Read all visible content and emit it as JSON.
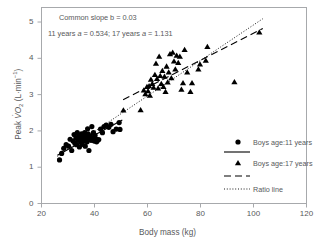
{
  "chart_data": {
    "type": "scatter",
    "title": "",
    "xlabel": "Body mass (kg)",
    "ylabel_plain": "Peak VO2 (L·min-1)",
    "xlim": [
      20,
      120
    ],
    "ylim": [
      0,
      5.4
    ],
    "xticks": [
      20,
      40,
      60,
      80,
      100,
      120
    ],
    "yticks": [
      0,
      1,
      2,
      3,
      4,
      5
    ],
    "grid": false,
    "legend_position": "right-middle",
    "annotations": [
      "Common  slope b = 0.03",
      "11 years a = 0.534; 17 years a = 1.131"
    ],
    "series": [
      {
        "name": "Boys age:11 years",
        "marker": "circle",
        "color": "#000000",
        "points": [
          [
            26.8,
            1.2
          ],
          [
            27.6,
            1.38
          ],
          [
            28.4,
            1.52
          ],
          [
            29.3,
            1.62
          ],
          [
            30.2,
            1.58
          ],
          [
            30.8,
            1.77
          ],
          [
            31.4,
            1.46
          ],
          [
            31.9,
            1.72
          ],
          [
            32.3,
            1.9
          ],
          [
            32.6,
            1.66
          ],
          [
            33.0,
            1.8
          ],
          [
            33.2,
            1.62
          ],
          [
            33.5,
            1.95
          ],
          [
            33.8,
            1.74
          ],
          [
            34.0,
            1.86
          ],
          [
            34.3,
            1.56
          ],
          [
            34.6,
            1.8
          ],
          [
            34.9,
            1.7
          ],
          [
            35.1,
            1.92
          ],
          [
            35.3,
            1.63
          ],
          [
            35.6,
            1.78
          ],
          [
            35.8,
            1.85
          ],
          [
            36.0,
            1.72
          ],
          [
            36.3,
            1.95
          ],
          [
            36.5,
            1.58
          ],
          [
            36.8,
            1.8
          ],
          [
            37.0,
            1.88
          ],
          [
            37.2,
            1.7
          ],
          [
            37.4,
            2.06
          ],
          [
            37.6,
            1.92
          ],
          [
            37.9,
            1.46
          ],
          [
            38.1,
            1.78
          ],
          [
            38.4,
            1.86
          ],
          [
            38.7,
            1.74
          ],
          [
            39.0,
            2.12
          ],
          [
            39.3,
            1.8
          ],
          [
            39.6,
            1.95
          ],
          [
            39.9,
            1.72
          ],
          [
            40.2,
            1.88
          ],
          [
            40.5,
            1.78
          ],
          [
            40.8,
            1.7
          ],
          [
            41.2,
            1.74
          ],
          [
            41.6,
            1.76
          ],
          [
            42.3,
            2.05
          ],
          [
            43.0,
            1.95
          ],
          [
            43.6,
            2.12
          ],
          [
            44.4,
            2.16
          ],
          [
            45.4,
            2.1
          ],
          [
            46.2,
            2.18
          ],
          [
            47.0,
            1.98
          ],
          [
            48.2,
            2.05
          ],
          [
            49.3,
            2.23
          ],
          [
            49.6,
            2.04
          ]
        ]
      },
      {
        "name": "Boys age:17 years",
        "marker": "triangle",
        "color": "#000000",
        "points": [
          [
            50.9,
            2.57
          ],
          [
            57.4,
            2.58
          ],
          [
            58.6,
            3.12
          ],
          [
            59.2,
            3.02
          ],
          [
            59.8,
            3.22
          ],
          [
            60.2,
            3.1
          ],
          [
            60.6,
            3.24
          ],
          [
            60.9,
            2.98
          ],
          [
            61.3,
            3.42
          ],
          [
            61.8,
            3.3
          ],
          [
            62.3,
            3.2
          ],
          [
            62.8,
            3.55
          ],
          [
            63.2,
            3.86
          ],
          [
            63.6,
            3.44
          ],
          [
            64.0,
            3.18
          ],
          [
            64.4,
            4.05
          ],
          [
            64.8,
            3.52
          ],
          [
            65.2,
            3.3
          ],
          [
            65.6,
            3.66
          ],
          [
            66.0,
            3.22
          ],
          [
            66.4,
            3.5
          ],
          [
            66.8,
            3.08
          ],
          [
            67.2,
            3.78
          ],
          [
            67.6,
            3.34
          ],
          [
            68.0,
            3.62
          ],
          [
            68.5,
            4.12
          ],
          [
            69.0,
            3.46
          ],
          [
            69.5,
            4.16
          ],
          [
            70.0,
            3.92
          ],
          [
            70.5,
            3.7
          ],
          [
            71.0,
            4.08
          ],
          [
            71.6,
            3.88
          ],
          [
            72.2,
            4.05
          ],
          [
            72.8,
            3.14
          ],
          [
            73.4,
            3.32
          ],
          [
            74.0,
            4.24
          ],
          [
            75.0,
            3.62
          ],
          [
            76.2,
            3.08
          ],
          [
            76.8,
            3.32
          ],
          [
            79.2,
            3.7
          ],
          [
            79.8,
            3.84
          ],
          [
            82.0,
            3.94
          ],
          [
            82.6,
            4.32
          ],
          [
            92.8,
            3.35
          ],
          [
            102.2,
            4.72
          ]
        ]
      }
    ],
    "lines": [
      {
        "name": "11-years regression",
        "style": "solid",
        "x": [
          26.0,
          50.5
        ],
        "y": [
          1.33,
          2.3
        ]
      },
      {
        "name": "17-years regression",
        "style": "dashed",
        "x": [
          50.8,
          103.5
        ],
        "y": [
          2.86,
          4.82
        ]
      },
      {
        "name": "Ratio line",
        "style": "dotted",
        "x": [
          26.0,
          103.5
        ],
        "y": [
          1.3,
          5.09
        ]
      }
    ]
  },
  "annotation": {
    "line1": "Common  slope b = 0.03",
    "line2_pre": "11 years ",
    "line2_a1": "a",
    "line2_mid": " = 0.534; 17 years ",
    "line2_a2": "a",
    "line2_post": " = 1.131"
  },
  "axes": {
    "x_title": "Body mass (kg)",
    "y_title_pre": "Peak ",
    "y_title_v": "V",
    "y_title_o": "O",
    "y_title_sub": "2",
    "y_title_unit_open": " (L·min",
    "y_title_sup": "−1",
    "y_title_close": ")",
    "xticks": [
      "20",
      "40",
      "60",
      "80",
      "100",
      "120"
    ],
    "yticks": [
      "0",
      "1",
      "2",
      "3",
      "4",
      "5"
    ]
  },
  "legend": {
    "items": [
      {
        "marker": "circle-marker",
        "label": "Boys age:11 years"
      },
      {
        "marker": "solid-line",
        "label": ""
      },
      {
        "marker": "triangle-marker",
        "label": "Boys age:17 years"
      },
      {
        "marker": "dashed-line",
        "label": ""
      },
      {
        "marker": "dotted-line",
        "label": "Ratio line"
      }
    ]
  },
  "colors": {
    "text": "#58595b",
    "frame": "#a7a9ac",
    "marker": "#000000"
  }
}
